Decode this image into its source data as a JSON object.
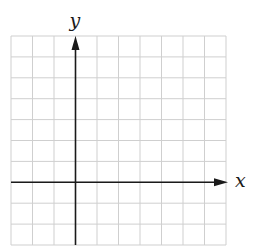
{
  "diagram": {
    "type": "coordinate-plane",
    "grid": {
      "columns": 10,
      "rows": 10,
      "left": 11,
      "top": 36,
      "right": 226,
      "bottom": 245,
      "line_color": "#cfcfcf"
    },
    "axes": {
      "color": "#1a1a1a",
      "y_axis_column_index": 3,
      "x_axis_row_index": 7,
      "x_label": "x",
      "y_label": "y"
    }
  }
}
